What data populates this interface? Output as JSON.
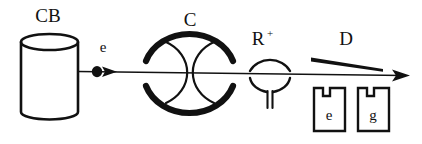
{
  "figure": {
    "type": "diagram",
    "background_color": "#ffffff",
    "ink_color": "#111111"
  },
  "labels": {
    "cathode_beam": "CB",
    "electron": "e",
    "condenser": "C",
    "reaction_target": "R",
    "reaction_target_superscript": "+",
    "detector": "D",
    "detector_box_left": "e",
    "detector_box_right": "g"
  },
  "components": [
    {
      "name": "cathode-beam-source",
      "label": "CB",
      "shape": "cylinder",
      "x": 20,
      "y": 34,
      "width": 58,
      "height": 79
    },
    {
      "name": "electron-marker",
      "label": "e",
      "shape": "filled-dot-with-arrowhead",
      "x": 97,
      "y": 72
    },
    {
      "name": "condenser-lens",
      "label": "C",
      "shape": "double-arc-lens",
      "x": 145,
      "y": 36,
      "width": 90,
      "height": 74
    },
    {
      "name": "reaction-target",
      "label": "R+",
      "shape": "arc-and-funnel",
      "x": 248,
      "y": 52,
      "width": 44,
      "height": 54
    },
    {
      "name": "detector-wedge",
      "label": "D",
      "shape": "tapered-line",
      "x": 311,
      "y": 52,
      "width": 72,
      "height": 14
    },
    {
      "name": "detector-box-electron",
      "label": "e",
      "shape": "notched-box",
      "x": 313,
      "y": 88,
      "width": 33,
      "height": 44
    },
    {
      "name": "detector-box-gamma",
      "label": "g",
      "shape": "notched-box",
      "x": 357,
      "y": 88,
      "width": 33,
      "height": 44
    },
    {
      "name": "beam-axis",
      "shape": "arrow-line",
      "x1": 78,
      "y1": 72,
      "x2": 410,
      "y2": 76
    }
  ]
}
